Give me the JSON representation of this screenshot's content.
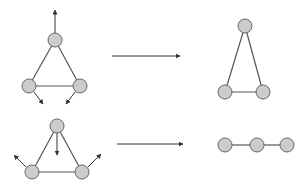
{
  "diagram": {
    "colors": {
      "node_fill": "#cccccc",
      "node_stroke": "#666666",
      "edge": "#555555",
      "arrow": "#333333",
      "background": "#ffffff"
    },
    "rows": [
      {
        "name": "row-1",
        "before": {
          "nodes": [
            {
              "id": "top",
              "x": 55,
              "y": 40
            },
            {
              "id": "left",
              "x": 29,
              "y": 86
            },
            {
              "id": "right",
              "x": 80,
              "y": 86
            }
          ],
          "edges": [
            [
              "top",
              "left"
            ],
            [
              "top",
              "right"
            ],
            [
              "left",
              "right"
            ]
          ],
          "force_arrows": [
            {
              "from": [
                55,
                33
              ],
              "to": [
                55,
                10
              ]
            },
            {
              "from": [
                34,
                92
              ],
              "to": [
                43,
                104
              ]
            },
            {
              "from": [
                75,
                92
              ],
              "to": [
                66,
                104
              ]
            }
          ]
        },
        "transition_arrow": {
          "from": [
            112,
            56
          ],
          "to": [
            180,
            56
          ]
        },
        "after": {
          "nodes": [
            {
              "id": "top",
              "x": 245,
              "y": 26
            },
            {
              "id": "left",
              "x": 225,
              "y": 92
            },
            {
              "id": "right",
              "x": 263,
              "y": 92
            }
          ],
          "edges": [
            [
              "top",
              "left"
            ],
            [
              "top",
              "right"
            ],
            [
              "left",
              "right"
            ]
          ]
        }
      },
      {
        "name": "row-2",
        "before": {
          "nodes": [
            {
              "id": "top",
              "x": 57,
              "y": 126
            },
            {
              "id": "left",
              "x": 32,
              "y": 172
            },
            {
              "id": "right",
              "x": 82,
              "y": 172
            }
          ],
          "edges": [
            [
              "top",
              "left"
            ],
            [
              "top",
              "right"
            ],
            [
              "left",
              "right"
            ]
          ],
          "force_arrows": [
            {
              "from": [
                57,
                133
              ],
              "to": [
                57,
                155
              ]
            },
            {
              "from": [
                26,
                167
              ],
              "to": [
                14,
                155
              ]
            },
            {
              "from": [
                88,
                167
              ],
              "to": [
                101,
                154
              ]
            }
          ]
        },
        "transition_arrow": {
          "from": [
            117,
            144
          ],
          "to": [
            183,
            144
          ]
        },
        "after": {
          "nodes": [
            {
              "id": "a",
              "x": 225,
              "y": 145
            },
            {
              "id": "b",
              "x": 257,
              "y": 145
            },
            {
              "id": "c",
              "x": 287,
              "y": 145
            }
          ],
          "edges": [
            [
              "a",
              "b"
            ],
            [
              "b",
              "c"
            ]
          ]
        }
      }
    ]
  }
}
